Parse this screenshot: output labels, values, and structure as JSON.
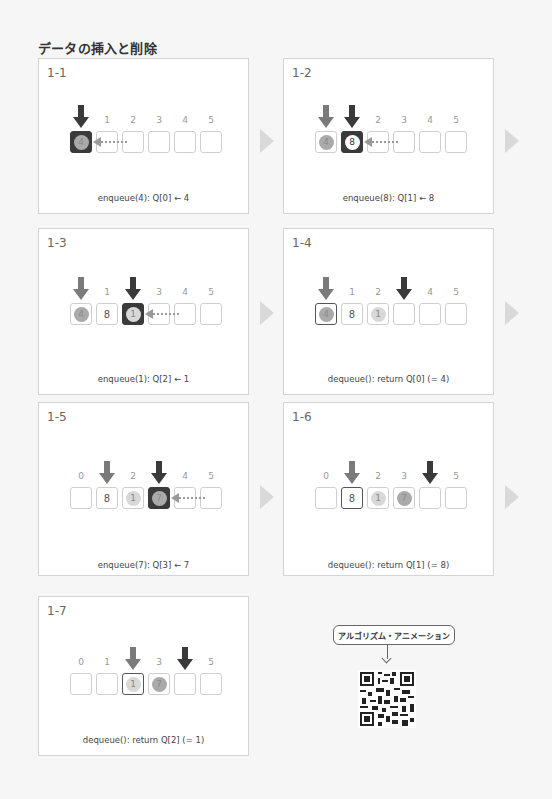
{
  "title": "データの挿入と削除",
  "indices": [
    "0",
    "1",
    "2",
    "3",
    "4",
    "5"
  ],
  "panels": [
    {
      "id": "1-1",
      "caption": "enqueue(4): Q[0] ← 4",
      "cells": [
        {
          "v": "4",
          "style": "dark",
          "ball": "mid"
        },
        {
          "v": ""
        },
        {
          "v": ""
        },
        {
          "v": ""
        },
        {
          "v": ""
        },
        {
          "v": ""
        }
      ],
      "hidden_idx": [
        0
      ],
      "head": null,
      "tail": 0,
      "insert_from": 1
    },
    {
      "id": "1-2",
      "caption": "enqueue(8): Q[1] ← 8",
      "cells": [
        {
          "v": "4",
          "ball": "mid"
        },
        {
          "v": "8",
          "style": "dark",
          "ball": "white"
        },
        {
          "v": ""
        },
        {
          "v": ""
        },
        {
          "v": ""
        },
        {
          "v": ""
        }
      ],
      "hidden_idx": [
        0,
        1
      ],
      "head": 0,
      "tail": 1,
      "insert_from": 2
    },
    {
      "id": "1-3",
      "caption": "enqueue(1): Q[2] ← 1",
      "cells": [
        {
          "v": "4",
          "ball": "mid"
        },
        {
          "v": "8"
        },
        {
          "v": "1",
          "style": "dark",
          "ball": "light"
        },
        {
          "v": ""
        },
        {
          "v": ""
        },
        {
          "v": ""
        }
      ],
      "hidden_idx": [
        0,
        2
      ],
      "head": 0,
      "tail": 2,
      "insert_from": 3
    },
    {
      "id": "1-4",
      "caption": "dequeue(): return Q[0] (= 4)",
      "cells": [
        {
          "v": "4",
          "style": "outlined",
          "ball": "mid"
        },
        {
          "v": "8"
        },
        {
          "v": "1",
          "ball": "light"
        },
        {
          "v": ""
        },
        {
          "v": ""
        },
        {
          "v": ""
        }
      ],
      "hidden_idx": [
        0,
        3
      ],
      "head": 0,
      "tail": 3,
      "insert_from": null
    },
    {
      "id": "1-5",
      "caption": "enqueue(7): Q[3] ← 7",
      "cells": [
        {
          "v": ""
        },
        {
          "v": "8"
        },
        {
          "v": "1",
          "ball": "light"
        },
        {
          "v": "7",
          "style": "dark",
          "ball": "mid"
        },
        {
          "v": ""
        },
        {
          "v": ""
        }
      ],
      "hidden_idx": [
        1,
        3
      ],
      "head": 1,
      "tail": 3,
      "insert_from": 4
    },
    {
      "id": "1-6",
      "caption": "dequeue(): return Q[1] (= 8)",
      "cells": [
        {
          "v": ""
        },
        {
          "v": "8",
          "style": "outlined"
        },
        {
          "v": "1",
          "ball": "light"
        },
        {
          "v": "7",
          "ball": "mid"
        },
        {
          "v": ""
        },
        {
          "v": ""
        }
      ],
      "hidden_idx": [
        1,
        4
      ],
      "head": 1,
      "tail": 4,
      "insert_from": null
    },
    {
      "id": "1-7",
      "caption": "dequeue(): return Q[2] (= 1)",
      "cells": [
        {
          "v": ""
        },
        {
          "v": ""
        },
        {
          "v": "1",
          "style": "outlined",
          "ball": "light"
        },
        {
          "v": "7",
          "ball": "mid"
        },
        {
          "v": ""
        },
        {
          "v": ""
        }
      ],
      "hidden_idx": [
        2,
        4
      ],
      "head": 2,
      "tail": 4,
      "insert_from": null
    }
  ],
  "animation_link": {
    "label": "アルゴリズム・アニメーション"
  },
  "colors": {
    "head_arrow": "#7a7a7a",
    "tail_arrow": "#3a3a3a",
    "next_arrow": "#d9d9d9"
  }
}
